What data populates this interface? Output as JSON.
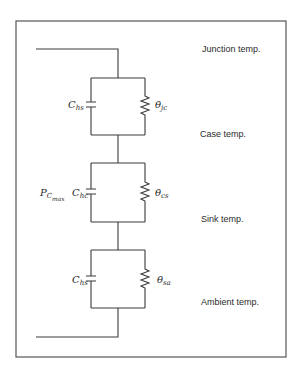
{
  "diagram": {
    "title": "",
    "node_labels": {
      "junction": "Junction temp.",
      "case": "Case temp.",
      "sink": "Sink temp.",
      "ambient": "Ambient temp."
    },
    "stages": [
      {
        "capacitor": {
          "symbol": "C",
          "subscript": "hs"
        },
        "resistor": {
          "symbol": "θ",
          "subscript": "jc"
        }
      },
      {
        "source": {
          "symbol": "P",
          "subscript": "C",
          "subsubscript": "max"
        },
        "capacitor": {
          "symbol": "C",
          "subscript": "hc"
        },
        "resistor": {
          "symbol": "θ",
          "subscript": "cs"
        }
      },
      {
        "capacitor": {
          "symbol": "C",
          "subscript": "hs"
        },
        "resistor": {
          "symbol": "θ",
          "subscript": "sa"
        }
      }
    ],
    "colors": {
      "line": "#3a3a3a",
      "frame": "#555555",
      "background": "#ffffff"
    }
  }
}
